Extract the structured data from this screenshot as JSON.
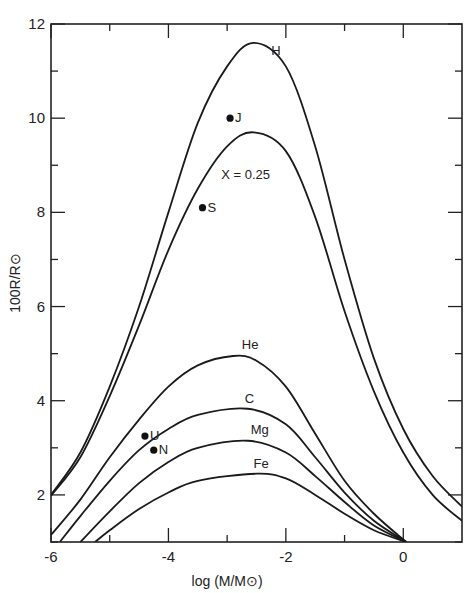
{
  "chart_data": {
    "type": "line",
    "title": "",
    "xlabel": "log (M/M⊙)",
    "ylabel": "100R/R⊙",
    "xlim": [
      -6,
      1
    ],
    "ylim": [
      1,
      12
    ],
    "grid": false,
    "legend": "inline curve labels",
    "x_ticks": [
      -6,
      -5,
      -4,
      -3,
      -2,
      -1,
      0
    ],
    "x_tick_labels": [
      "-6",
      "-4",
      "-2",
      "0"
    ],
    "y_ticks": [
      1,
      2,
      3,
      4,
      5,
      6,
      7,
      8,
      9,
      10,
      11,
      12
    ],
    "y_tick_labels": [
      "2",
      "4",
      "6",
      "8",
      "10",
      "12"
    ],
    "series": [
      {
        "name": "H",
        "label": "H",
        "points": [
          [
            -6,
            2.0
          ],
          [
            -5.5,
            2.9
          ],
          [
            -5,
            4.3
          ],
          [
            -4.5,
            6.0
          ],
          [
            -4,
            8.0
          ],
          [
            -3.5,
            9.9
          ],
          [
            -3,
            11.1
          ],
          [
            -2.55,
            11.6
          ],
          [
            -2,
            11.1
          ],
          [
            -1.5,
            9.4
          ],
          [
            -1,
            7.0
          ],
          [
            -0.5,
            4.9
          ],
          [
            0,
            3.4
          ],
          [
            0.5,
            2.4
          ],
          [
            1,
            1.75
          ]
        ]
      },
      {
        "name": "X = 0.25",
        "label": "X = 0.25",
        "points": [
          [
            -6,
            1.98
          ],
          [
            -5.5,
            2.8
          ],
          [
            -5,
            4.1
          ],
          [
            -4.5,
            5.6
          ],
          [
            -4,
            7.2
          ],
          [
            -3.5,
            8.5
          ],
          [
            -3,
            9.4
          ],
          [
            -2.55,
            9.7
          ],
          [
            -2,
            9.3
          ],
          [
            -1.5,
            7.9
          ],
          [
            -1,
            5.9
          ],
          [
            -0.5,
            4.2
          ],
          [
            0,
            2.9
          ],
          [
            0.5,
            2.0
          ],
          [
            1,
            1.45
          ]
        ]
      },
      {
        "name": "He",
        "label": "He",
        "points": [
          [
            -6,
            1.15
          ],
          [
            -5.5,
            1.9
          ],
          [
            -5,
            2.8
          ],
          [
            -4.5,
            3.6
          ],
          [
            -4,
            4.3
          ],
          [
            -3.5,
            4.75
          ],
          [
            -2.9,
            4.95
          ],
          [
            -2.5,
            4.85
          ],
          [
            -2,
            4.3
          ],
          [
            -1.5,
            3.3
          ],
          [
            -1,
            2.3
          ],
          [
            -0.5,
            1.6
          ],
          [
            0.05,
            1.0
          ]
        ]
      },
      {
        "name": "C",
        "label": "C",
        "points": [
          [
            -5.85,
            1.0
          ],
          [
            -5.5,
            1.55
          ],
          [
            -5,
            2.3
          ],
          [
            -4.5,
            2.95
          ],
          [
            -4,
            3.4
          ],
          [
            -3.5,
            3.7
          ],
          [
            -2.65,
            3.83
          ],
          [
            -2,
            3.5
          ],
          [
            -1.5,
            2.8
          ],
          [
            -1,
            2.05
          ],
          [
            -0.5,
            1.45
          ],
          [
            0.05,
            1.0
          ]
        ]
      },
      {
        "name": "Mg",
        "label": "Mg",
        "points": [
          [
            -5.5,
            1.0
          ],
          [
            -5,
            1.65
          ],
          [
            -4.5,
            2.25
          ],
          [
            -4,
            2.7
          ],
          [
            -3.5,
            3.0
          ],
          [
            -2.65,
            3.15
          ],
          [
            -2,
            2.9
          ],
          [
            -1.5,
            2.4
          ],
          [
            -1,
            1.85
          ],
          [
            -0.5,
            1.35
          ],
          [
            0.05,
            1.0
          ]
        ]
      },
      {
        "name": "Fe",
        "label": "Fe",
        "points": [
          [
            -5.25,
            1.0
          ],
          [
            -5,
            1.25
          ],
          [
            -4.5,
            1.7
          ],
          [
            -4,
            2.05
          ],
          [
            -3.5,
            2.3
          ],
          [
            -2.5,
            2.45
          ],
          [
            -2,
            2.35
          ],
          [
            -1.5,
            2.0
          ],
          [
            -1,
            1.6
          ],
          [
            -0.5,
            1.25
          ],
          [
            0.05,
            1.0
          ]
        ]
      }
    ],
    "points": [
      {
        "label": "J",
        "x": -2.95,
        "y": 10.0
      },
      {
        "label": "S",
        "x": -3.42,
        "y": 8.1
      },
      {
        "label": "U",
        "x": -4.4,
        "y": 3.25
      },
      {
        "label": "N",
        "x": -4.25,
        "y": 2.95
      }
    ],
    "annotations": [
      "H",
      "X = 0.25",
      "He",
      "C",
      "Mg",
      "Fe",
      "J",
      "S",
      "U",
      "N"
    ]
  }
}
